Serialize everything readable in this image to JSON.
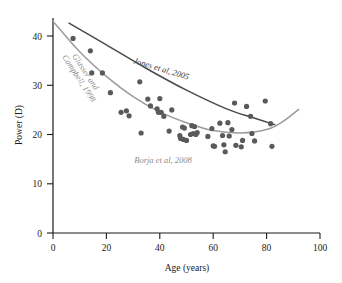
{
  "chart_data": {
    "type": "scatter",
    "title": "",
    "xlabel": "Age (years)",
    "ylabel": "Power (D)",
    "xlim": [
      0,
      100
    ],
    "ylim": [
      0,
      44
    ],
    "xticks": [
      0,
      20,
      40,
      60,
      80,
      100
    ],
    "yticks": [
      0,
      10,
      20,
      30,
      40
    ],
    "grid": false,
    "legend": "none (inline curve annotations)",
    "series": [
      {
        "name": "Borja et al, 2008",
        "type": "scatter",
        "color": "#5a5a5a",
        "points": [
          [
            7.5,
            39.5
          ],
          [
            14.0,
            37.0
          ],
          [
            14.5,
            32.5
          ],
          [
            18.5,
            32.5
          ],
          [
            21.5,
            28.5
          ],
          [
            25.5,
            24.5
          ],
          [
            27.5,
            24.8
          ],
          [
            28.5,
            23.8
          ],
          [
            32.5,
            30.7
          ],
          [
            33.0,
            20.3
          ],
          [
            35.5,
            27.2
          ],
          [
            36.5,
            25.8
          ],
          [
            39.0,
            25.2
          ],
          [
            39.5,
            24.5
          ],
          [
            40.0,
            27.3
          ],
          [
            40.5,
            24.5
          ],
          [
            41.5,
            23.7
          ],
          [
            43.5,
            20.7
          ],
          [
            44.5,
            25.0
          ],
          [
            47.5,
            19.8
          ],
          [
            47.8,
            19.2
          ],
          [
            48.5,
            21.5
          ],
          [
            48.8,
            19.0
          ],
          [
            49.2,
            21.3
          ],
          [
            50.0,
            18.8
          ],
          [
            51.5,
            20.0
          ],
          [
            52.0,
            21.8
          ],
          [
            52.5,
            20.2
          ],
          [
            53.0,
            21.6
          ],
          [
            53.5,
            20.0
          ],
          [
            54.0,
            20.4
          ],
          [
            58.0,
            19.6
          ],
          [
            59.5,
            21.2
          ],
          [
            60.0,
            17.7
          ],
          [
            60.5,
            17.6
          ],
          [
            62.5,
            22.3
          ],
          [
            63.5,
            19.8
          ],
          [
            64.0,
            17.9
          ],
          [
            64.5,
            16.5
          ],
          [
            65.5,
            22.4
          ],
          [
            66.0,
            19.7
          ],
          [
            67.0,
            21.0
          ],
          [
            68.0,
            26.4
          ],
          [
            68.5,
            17.8
          ],
          [
            70.5,
            17.5
          ],
          [
            71.0,
            18.8
          ],
          [
            72.5,
            25.7
          ],
          [
            74.0,
            23.7
          ],
          [
            74.5,
            20.2
          ],
          [
            75.5,
            18.7
          ],
          [
            79.5,
            26.8
          ],
          [
            81.5,
            22.2
          ],
          [
            82.0,
            17.6
          ]
        ]
      },
      {
        "name": "Jones et al, 2005",
        "type": "line",
        "color": "#4a4a4a",
        "x": [
          6,
          20,
          35,
          50,
          65,
          75,
          83
        ],
        "y": [
          42.6,
          38.2,
          33.4,
          29.0,
          25.2,
          23.4,
          22.0
        ]
      },
      {
        "name": "Glasser and Campbell, 1998",
        "type": "line",
        "color": "#9b9b9b",
        "x": [
          0,
          10,
          20,
          30,
          40,
          50,
          60,
          70,
          80,
          86,
          92
        ],
        "y": [
          43.0,
          36.8,
          31.8,
          27.7,
          24.6,
          22.4,
          20.8,
          20.3,
          21.0,
          22.6,
          25.1
        ]
      }
    ],
    "annotations": [
      {
        "text": "Jones et al, 2005",
        "x": 30,
        "y": 34.5,
        "color": "#3b3b3b",
        "rotation": 18
      },
      {
        "text": "Glasser and",
        "x": 10,
        "y": 31.5,
        "color": "#8d8d8d",
        "rotation": 57
      },
      {
        "text": "Campbell, 1998",
        "x": 6,
        "y": 30.0,
        "color": "#8d8d8d",
        "rotation": 57
      },
      {
        "text": "Borja et al, 2008",
        "x": 48,
        "y": 14.2,
        "color": "#8d8d8d",
        "rotation": 0
      }
    ]
  },
  "axes": {
    "x": {
      "title": "Age (years)",
      "ticks": [
        "0",
        "20",
        "40",
        "60",
        "80",
        "100"
      ]
    },
    "y": {
      "title": "Power (D)",
      "ticks": [
        "0",
        "10",
        "20",
        "30",
        "40"
      ]
    }
  },
  "annotations": {
    "jones": "Jones et al, 2005",
    "glasser_line1": "Glasser and",
    "glasser_line2": "Campbell, 1998",
    "borja": "Borja et al, 2008"
  },
  "colors": {
    "points": "#5a5a5a",
    "jones_curve": "#4a4a4a",
    "glasser_curve": "#9b9b9b",
    "axis": "#1a1a1a",
    "background": "#ffffff"
  }
}
